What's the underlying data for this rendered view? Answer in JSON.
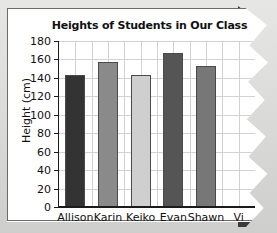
{
  "figure": {
    "background_color": "#d9d9d7",
    "paper_color": "#ffffff",
    "frame_color": "#6b6b6b",
    "torn_edge": "right",
    "torn_shadow_color": "#3a3a3a"
  },
  "chart_data": {
    "type": "bar",
    "title": "Heights of Students in Our Class",
    "xlabel": "",
    "ylabel": "Height (cm)",
    "categories": [
      "Allison",
      "Karin",
      "Keiko",
      "Evan",
      "Shawn",
      "Vi"
    ],
    "values": [
      143,
      157,
      143,
      167,
      153,
      null
    ],
    "bar_colors": [
      "#333333",
      "#8a8a8a",
      "#cfcfcf",
      "#555555",
      "#777777",
      "#666666"
    ],
    "ylim": [
      0,
      180
    ],
    "ytick_step": 20,
    "yticks": [
      0,
      20,
      40,
      60,
      80,
      100,
      120,
      140,
      160,
      180
    ],
    "ytick_labels": [
      "0",
      "20",
      "40",
      "60",
      "80",
      "100",
      "120",
      "140",
      "160",
      "180"
    ],
    "grid": true,
    "grid_color": "#d2d2d2",
    "legend": null
  },
  "axis": {
    "y_title": "Height (cm)",
    "axis_color": "#1b1b1b"
  }
}
